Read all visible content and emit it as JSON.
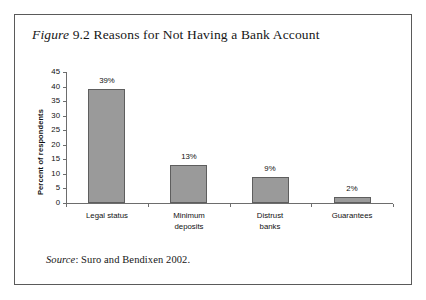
{
  "figure": {
    "label_italic": "Figure",
    "number_and_title": " 9.2 Reasons for Not Having a Bank Account",
    "source_label_italic": "Source",
    "source_text": ": Suro and Bendixen 2002."
  },
  "colors": {
    "bar_fill": "#9a9a9a",
    "bar_stroke": "#5e5e5e",
    "axis": "#6d6d6d",
    "box_border": "#5a5a5a",
    "text": "#111111",
    "background": "#ffffff"
  },
  "chart_data": {
    "type": "bar",
    "title": "Figure 9.2 Reasons for Not Having a Bank Account",
    "xlabel": "",
    "ylabel": "Percent of respondents",
    "categories": [
      "Legal status",
      "Minimum deposits",
      "Distrust banks",
      "Guarantees"
    ],
    "category_lines": [
      [
        "Legal status"
      ],
      [
        "Minimum",
        "deposits"
      ],
      [
        "Distrust",
        "banks"
      ],
      [
        "Guarantees"
      ]
    ],
    "values": [
      39,
      13,
      9,
      2
    ],
    "data_labels": [
      "39%",
      "13%",
      "9%",
      "2%"
    ],
    "ylim": [
      0,
      45
    ],
    "ytick_values": [
      0,
      5,
      10,
      15,
      20,
      25,
      30,
      35,
      40,
      45
    ],
    "ytick_labels": [
      "0",
      "5",
      "10",
      "15",
      "20",
      "25",
      "30",
      "35",
      "40",
      "45"
    ],
    "grid": false,
    "legend": false,
    "source": "Source: Suro and Bendixen 2002."
  }
}
